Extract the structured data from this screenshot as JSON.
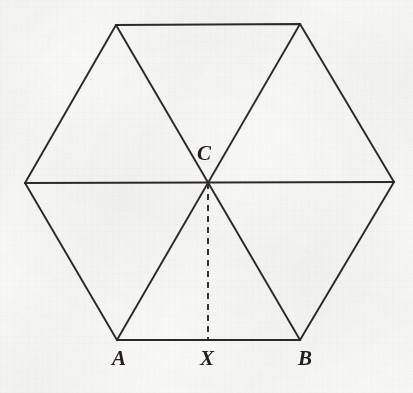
{
  "figure": {
    "kind": "geometry-diagram",
    "canvas": {
      "width": 413,
      "height": 393
    },
    "background_color": "#f8f8f6",
    "stroke_color": "#2b2a28",
    "label_color": "#201f1e",
    "stroke_width": 1.9,
    "dash_pattern": "6 5",
    "points": {
      "left": {
        "name": "left-vertex",
        "x": 25,
        "y": 183
      },
      "top_left": {
        "name": "top-left-vertex",
        "x": 116,
        "y": 25
      },
      "top_right": {
        "name": "top-right-vertex",
        "x": 300,
        "y": 24
      },
      "right": {
        "name": "right-vertex",
        "x": 394,
        "y": 182
      },
      "bottom_right": {
        "name": "bottom-right-vertex",
        "x": 300,
        "y": 340
      },
      "bottom_left": {
        "name": "bottom-left-vertex",
        "x": 117,
        "y": 340
      },
      "center": {
        "name": "center-point",
        "x": 208,
        "y": 183
      },
      "foot": {
        "name": "foot-of-altitude",
        "x": 208,
        "y": 340
      }
    },
    "outline_path": "M 25 183 L 116 25 L 300 24 L 394 182 L 300 340 L 117 340 Z",
    "diagonals": [
      {
        "name": "diagonal-left-to-right",
        "x1": 25,
        "y1": 183,
        "x2": 394,
        "y2": 182
      },
      {
        "name": "diagonal-top-left-to-bottom-right",
        "x1": 116,
        "y1": 25,
        "x2": 300,
        "y2": 340
      },
      {
        "name": "diagonal-top-right-to-bottom-left",
        "x1": 300,
        "y1": 24,
        "x2": 117,
        "y2": 340
      }
    ],
    "altitude": {
      "name": "altitude-C-to-X",
      "x1": 208,
      "y1": 183,
      "x2": 208,
      "y2": 340,
      "style": "dashed"
    },
    "labels": [
      {
        "id": "C",
        "text": "C",
        "x": 197,
        "y": 143,
        "anchor": "top-left",
        "note": "labels the center point"
      },
      {
        "id": "A",
        "text": "A",
        "x": 112,
        "y": 348,
        "anchor": "top-left",
        "note": "labels the bottom-left vertex"
      },
      {
        "id": "X",
        "text": "X",
        "x": 200,
        "y": 348,
        "anchor": "top-left",
        "note": "labels the foot of the altitude on AB"
      },
      {
        "id": "B",
        "text": "B",
        "x": 298,
        "y": 348,
        "anchor": "top-left",
        "note": "labels the bottom-right vertex"
      }
    ]
  }
}
